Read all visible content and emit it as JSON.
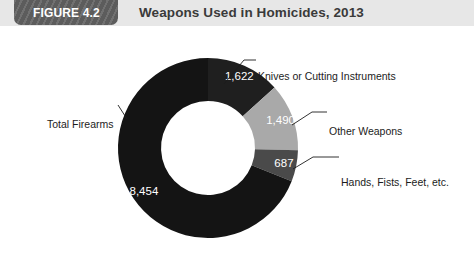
{
  "header": {
    "badge_label": "FIGURE 4.2",
    "title": "Weapons Used in Homicides, 2013",
    "band_color": "#e7e7e7",
    "badge_color": "#5c5c5c"
  },
  "chart_data": {
    "type": "pie",
    "variant": "donut",
    "title": "Weapons Used in Homicides, 2013",
    "xlabel": "",
    "ylabel": "",
    "legend_position": "callout-labels",
    "grid": false,
    "start_angle_deg": 0,
    "direction": "clockwise",
    "categories": [
      "Knives or Cutting Instruments",
      "Other Weapons",
      "Hands, Fists, Feet, etc.",
      "Total Firearms"
    ],
    "values": [
      1622,
      1490,
      687,
      8454
    ],
    "value_labels": [
      "1,622",
      "1,490",
      "687",
      "8,454"
    ],
    "colors": [
      "#1f1f1f",
      "#a9a9a9",
      "#4a4a4a",
      "#141414"
    ],
    "total": 12253
  },
  "callouts": {
    "knives": "Knives or Cutting Instruments",
    "other": "Other Weapons",
    "hands": "Hands, Fists, Feet, etc.",
    "firearms": "Total Firearms"
  }
}
